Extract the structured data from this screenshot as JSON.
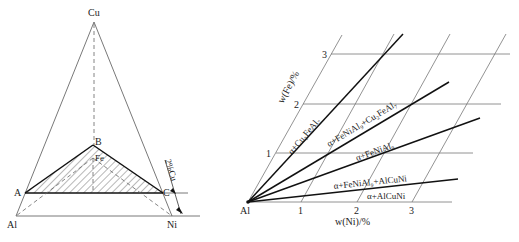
{
  "left_diagram": {
    "vertices": {
      "cu": "Cu",
      "al": "Al",
      "ni": "Ni",
      "a": "A",
      "b": "B",
      "c": "C",
      "fe": "Fe"
    },
    "dimension_label": "2%Cu"
  },
  "right_diagram": {
    "origin_label": "Al",
    "x_axis_label": "w(Ni)/%",
    "y_axis_label": "w(Fe)/%",
    "x_ticks": [
      "1",
      "2",
      "3"
    ],
    "y_ticks": [
      "1",
      "2",
      "3"
    ],
    "regions": [
      {
        "label": "α+Cu₂FeAl₇"
      },
      {
        "label": "α+FeNiAl₉+Cu₂FeAl₇"
      },
      {
        "label": "α+FeNiAl₉"
      },
      {
        "label": "α+FeNiAl₉+AlCuNi"
      },
      {
        "label": "α+AlCuNi"
      }
    ]
  },
  "colors": {
    "line": "#111111",
    "thin_line": "#555555",
    "background": "#ffffff"
  }
}
